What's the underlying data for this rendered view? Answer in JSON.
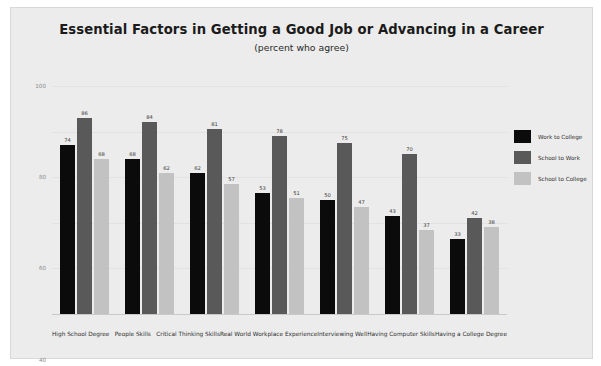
{
  "chart_data": {
    "type": "bar",
    "title": "Essential Factors in Getting a Good Job or Advancing in a Career",
    "subtitle": "(percent who agree)",
    "xlabel": "",
    "ylabel": "",
    "ylim": [
      0,
      100
    ],
    "yticks": [
      100,
      80,
      60,
      40,
      20
    ],
    "grid": true,
    "legend_position": "right",
    "categories": [
      "High School Degree",
      "People Skills",
      "Critical Thinking Skills",
      "Real World Workplace Experience",
      "Interviewing Well",
      "Having Computer Skills",
      "Having a College Degree"
    ],
    "series": [
      {
        "name": "Work to College",
        "color": "#0b0b0b",
        "values": [
          74,
          68,
          62,
          53,
          50,
          43,
          33
        ]
      },
      {
        "name": "School to Work",
        "color": "#595959",
        "values": [
          86,
          84,
          81,
          78,
          75,
          70,
          42
        ]
      },
      {
        "name": "School to College",
        "color": "#c2c2c2",
        "values": [
          68,
          62,
          57,
          51,
          47,
          37,
          38
        ]
      }
    ]
  },
  "colors": {
    "card_background": "#ececec",
    "page_background": "#ffffff",
    "gridline": "#e2e2e2",
    "axis": "#c9c9c9",
    "title_text": "#1b1b1b",
    "tick_text": "#8a8a8a"
  }
}
